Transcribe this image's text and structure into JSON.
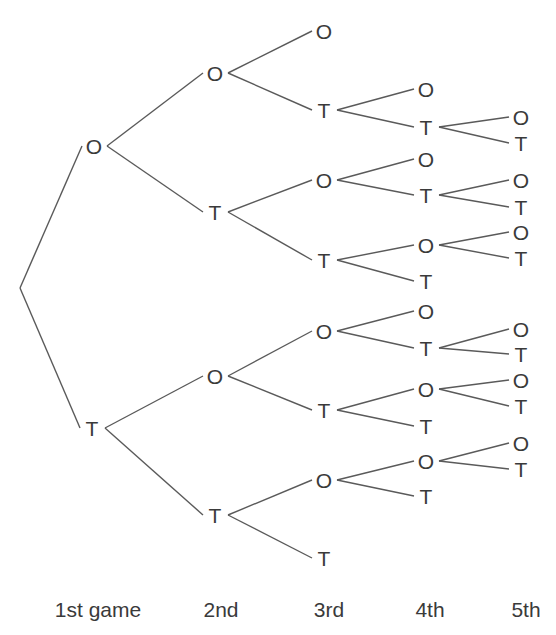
{
  "diagram": {
    "type": "tree",
    "colors": {
      "line": "#5a5a5a",
      "text": "#3a3a3a",
      "background": "#ffffff"
    },
    "root": {
      "x": 20,
      "y": 288
    },
    "nodes": [
      {
        "id": "g1O",
        "label": "O",
        "x": 94,
        "y": 146,
        "parent": "root"
      },
      {
        "id": "g1T",
        "label": "T",
        "x": 92,
        "y": 428,
        "parent": "root"
      },
      {
        "id": "g2OO",
        "label": "O",
        "x": 215,
        "y": 73,
        "parent": "g1O"
      },
      {
        "id": "g2OT",
        "label": "T",
        "x": 215,
        "y": 212,
        "parent": "g1O"
      },
      {
        "id": "g2TO",
        "label": "O",
        "x": 215,
        "y": 376,
        "parent": "g1T"
      },
      {
        "id": "g2TT",
        "label": "T",
        "x": 215,
        "y": 515,
        "parent": "g1T"
      },
      {
        "id": "g3OOO",
        "label": "O",
        "x": 324,
        "y": 31,
        "parent": "g2OO"
      },
      {
        "id": "g3OOT",
        "label": "T",
        "x": 324,
        "y": 110,
        "parent": "g2OO"
      },
      {
        "id": "g3OTO",
        "label": "O",
        "x": 324,
        "y": 180,
        "parent": "g2OT"
      },
      {
        "id": "g3OTT",
        "label": "T",
        "x": 324,
        "y": 260,
        "parent": "g2OT"
      },
      {
        "id": "g3TOO",
        "label": "O",
        "x": 324,
        "y": 331,
        "parent": "g2TO"
      },
      {
        "id": "g3TOT",
        "label": "T",
        "x": 324,
        "y": 410,
        "parent": "g2TO"
      },
      {
        "id": "g3TTO",
        "label": "O",
        "x": 324,
        "y": 480,
        "parent": "g2TT"
      },
      {
        "id": "g3TTT",
        "label": "T",
        "x": 324,
        "y": 558,
        "parent": "g2TT"
      },
      {
        "id": "g4a",
        "label": "O",
        "x": 426,
        "y": 89,
        "parent": "g3OOT"
      },
      {
        "id": "g4b",
        "label": "T",
        "x": 426,
        "y": 127,
        "parent": "g3OOT"
      },
      {
        "id": "g4c",
        "label": "O",
        "x": 426,
        "y": 159,
        "parent": "g3OTO"
      },
      {
        "id": "g4d",
        "label": "T",
        "x": 426,
        "y": 195,
        "parent": "g3OTO"
      },
      {
        "id": "g4e",
        "label": "O",
        "x": 426,
        "y": 245,
        "parent": "g3OTT"
      },
      {
        "id": "g4f",
        "label": "T",
        "x": 426,
        "y": 281,
        "parent": "g3OTT"
      },
      {
        "id": "g4g",
        "label": "O",
        "x": 426,
        "y": 311,
        "parent": "g3TOO"
      },
      {
        "id": "g4h",
        "label": "T",
        "x": 426,
        "y": 348,
        "parent": "g3TOO"
      },
      {
        "id": "g4i",
        "label": "O",
        "x": 426,
        "y": 389,
        "parent": "g3TOT"
      },
      {
        "id": "g4j",
        "label": "T",
        "x": 426,
        "y": 426,
        "parent": "g3TOT"
      },
      {
        "id": "g4k",
        "label": "O",
        "x": 426,
        "y": 461,
        "parent": "g3TTO"
      },
      {
        "id": "g4l",
        "label": "T",
        "x": 426,
        "y": 496,
        "parent": "g3TTO"
      },
      {
        "id": "g5a",
        "label": "O",
        "x": 521,
        "y": 117,
        "parent": "g4b"
      },
      {
        "id": "g5b",
        "label": "T",
        "x": 521,
        "y": 143,
        "parent": "g4b"
      },
      {
        "id": "g5c",
        "label": "O",
        "x": 521,
        "y": 180,
        "parent": "g4d"
      },
      {
        "id": "g5d",
        "label": "T",
        "x": 521,
        "y": 207,
        "parent": "g4d"
      },
      {
        "id": "g5e",
        "label": "O",
        "x": 521,
        "y": 232,
        "parent": "g4e"
      },
      {
        "id": "g5f",
        "label": "T",
        "x": 521,
        "y": 258,
        "parent": "g4e"
      },
      {
        "id": "g5g",
        "label": "O",
        "x": 521,
        "y": 329,
        "parent": "g4h"
      },
      {
        "id": "g5h",
        "label": "T",
        "x": 521,
        "y": 354,
        "parent": "g4h"
      },
      {
        "id": "g5i",
        "label": "O",
        "x": 521,
        "y": 380,
        "parent": "g4i"
      },
      {
        "id": "g5j",
        "label": "T",
        "x": 521,
        "y": 406,
        "parent": "g4i"
      },
      {
        "id": "g5k",
        "label": "O",
        "x": 521,
        "y": 443,
        "parent": "g4k"
      },
      {
        "id": "g5l",
        "label": "T",
        "x": 521,
        "y": 469,
        "parent": "g4k"
      }
    ],
    "axis_labels": [
      {
        "text": "1st game",
        "x": 98,
        "y": 610
      },
      {
        "text": "2nd",
        "x": 221,
        "y": 610
      },
      {
        "text": "3rd",
        "x": 329,
        "y": 610
      },
      {
        "text": "4th",
        "x": 430,
        "y": 610
      },
      {
        "text": "5th",
        "x": 526,
        "y": 610
      }
    ]
  }
}
